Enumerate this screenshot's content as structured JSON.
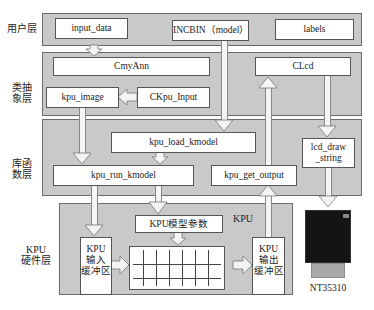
{
  "layers": {
    "user": "用户层",
    "class_abstraction": "类抽\n象层",
    "library": "库函\n数层",
    "kpu_hardware": "KPU\n硬件层"
  },
  "user_layer": {
    "input_data": "input_data",
    "incbin": "INCBIN（model）",
    "labels": "labels"
  },
  "class_layer": {
    "cmyann": "CmyAnn",
    "clcd": "CLcd",
    "kpu_image": "kpu_image",
    "ckpu_input": "CKpu_Input"
  },
  "library_layer": {
    "kpu_load_kmodel": "kpu_load_kmodel",
    "kpu_run_kmodel": "kpu_run_kmodel",
    "kpu_get_output": "kpu_get_output",
    "lcd_draw_string_1": "lcd_draw",
    "lcd_draw_string_2": "_string"
  },
  "hardware_layer": {
    "kpu_title": "KPU",
    "model_params": "KPU模型参数",
    "input_buffer": [
      "KPU",
      "输入",
      "缓冲区"
    ],
    "output_buffer": [
      "KPU",
      "输出",
      "缓冲区"
    ]
  },
  "display": {
    "label": "NT35310"
  },
  "colors": {
    "layer_fill": "#c9c9c9",
    "box_fill": "#ffffff",
    "border": "#555555",
    "lcd_screen": "#141414",
    "lcd_connector": "#a9a9a9"
  }
}
